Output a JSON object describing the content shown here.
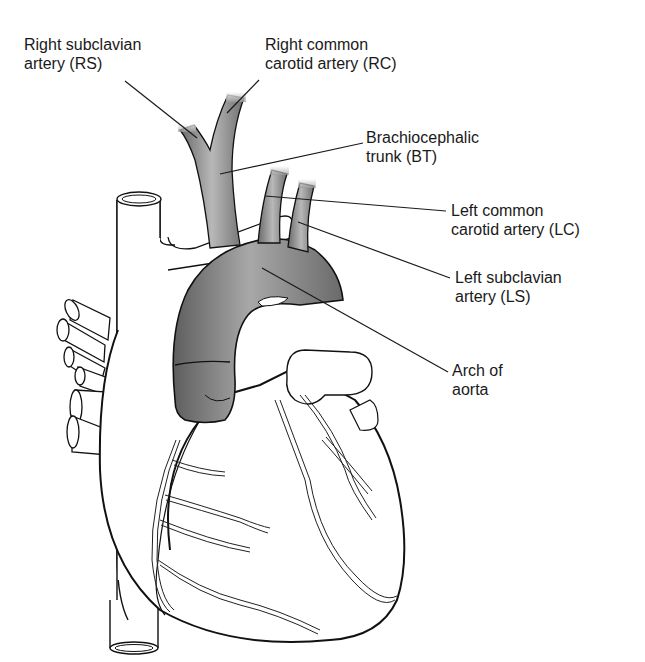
{
  "diagram": {
    "labels": [
      {
        "id": "RS",
        "line1": "Right subclavian",
        "line2": "artery (RS)",
        "x": 24,
        "y": 35
      },
      {
        "id": "RC",
        "line1": "Right common",
        "line2": "carotid artery (RC)",
        "x": 265,
        "y": 35
      },
      {
        "id": "BT",
        "line1": "Brachiocephalic",
        "line2": "trunk (BT)",
        "x": 366,
        "y": 128
      },
      {
        "id": "LC",
        "line1": "Left common",
        "line2": "carotid artery (LC)",
        "x": 451,
        "y": 201
      },
      {
        "id": "LS",
        "line1": "Left subclavian",
        "line2": "artery (LS)",
        "x": 455,
        "y": 268
      },
      {
        "id": "AA",
        "line1": "Arch of",
        "line2": "aorta",
        "x": 452,
        "y": 361
      }
    ],
    "leader_lines": [
      {
        "label": "RS",
        "x1": 125,
        "y1": 81,
        "x2": 197,
        "y2": 138
      },
      {
        "label": "RC",
        "x1": 259,
        "y1": 80,
        "x2": 227,
        "y2": 113
      },
      {
        "label": "BT",
        "x1": 363,
        "y1": 143,
        "x2": 220,
        "y2": 174
      },
      {
        "label": "LC",
        "x1": 446,
        "y1": 211,
        "x2": 265,
        "y2": 196
      },
      {
        "label": "LS",
        "x1": 450,
        "y1": 278,
        "x2": 298,
        "y2": 222
      },
      {
        "label": "AA",
        "x1": 448,
        "y1": 372,
        "x2": 262,
        "y2": 268
      }
    ],
    "colors": {
      "vessel_fill": "#8c8c8c",
      "vessel_dark": "#5a5a5a",
      "vessel_light": "#c4c4c4",
      "outline": "#111111",
      "text": "#1a1a1a",
      "background": "#ffffff"
    }
  }
}
